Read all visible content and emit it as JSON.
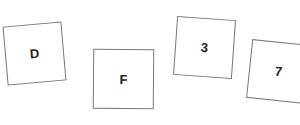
{
  "cards": [
    {
      "label": "D"
    },
    {
      "label": "F"
    },
    {
      "label": "3"
    },
    {
      "label": "7"
    }
  ]
}
